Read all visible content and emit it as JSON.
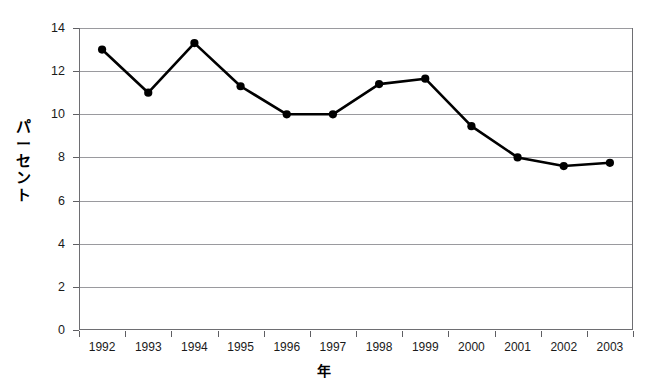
{
  "top_caption": "",
  "chart_data": {
    "type": "line",
    "title": "",
    "xlabel": "年",
    "ylabel": "パーセント",
    "ylabel_chars": [
      "パ",
      "ー",
      "セ",
      "ン",
      "ト"
    ],
    "categories": [
      "1992",
      "1993",
      "1994",
      "1995",
      "1996",
      "1997",
      "1998",
      "1999",
      "2000",
      "2001",
      "2002",
      "2003"
    ],
    "values": [
      13.0,
      11.0,
      13.3,
      11.3,
      10.0,
      10.0,
      11.4,
      11.65,
      9.45,
      8.0,
      7.6,
      7.75
    ],
    "series": [
      {
        "name": "パーセント",
        "values": [
          13.0,
          11.0,
          13.3,
          11.3,
          10.0,
          10.0,
          11.4,
          11.65,
          9.45,
          8.0,
          7.6,
          7.75
        ],
        "color": "#000000",
        "marker": "filled-circle"
      }
    ],
    "ylim": [
      0,
      14
    ],
    "yticks": [
      0,
      2,
      4,
      6,
      8,
      10,
      12,
      14
    ],
    "ytick_labels": [
      "0",
      "2",
      "4",
      "6",
      "8",
      "10",
      "12",
      "14"
    ],
    "xlim": [
      "1992",
      "2003"
    ],
    "grid": "horizontal",
    "grid_color": "#9a9a9e",
    "legend": "none",
    "frame_color": "#6e6e72",
    "background": "#ffffff"
  }
}
